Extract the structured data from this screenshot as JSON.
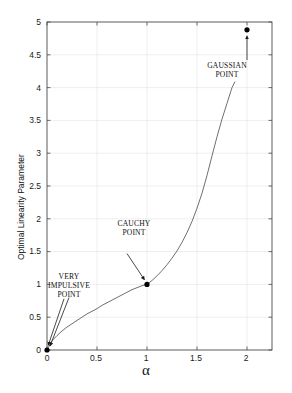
{
  "chart_data": {
    "type": "line",
    "title": "",
    "xlabel": "α",
    "ylabel": "Optimal Linearity Parameter",
    "xlim": [
      0,
      2.25
    ],
    "ylim": [
      0,
      5
    ],
    "grid": true,
    "grid_color": "#d9d9d9",
    "line_color": "#555555",
    "marker_color": "#000000",
    "xticks": [
      "0",
      "0.5",
      "1",
      "1.5",
      "2"
    ],
    "xtick_values": [
      0,
      0.5,
      1,
      1.5,
      2
    ],
    "yticks": [
      "0",
      "0.5",
      "1",
      "1.5",
      "2",
      "2.5",
      "3",
      "3.5",
      "4",
      "4.5",
      "5"
    ],
    "ytick_values": [
      0,
      0.5,
      1,
      1.5,
      2,
      2.5,
      3,
      3.5,
      4,
      4.5,
      5
    ],
    "series": [
      {
        "name": "optimal linearity parameter",
        "x": [
          0.0,
          0.05,
          0.1,
          0.15,
          0.2,
          0.25,
          0.3,
          0.35,
          0.4,
          0.45,
          0.5,
          0.55,
          0.6,
          0.65,
          0.7,
          0.75,
          0.8,
          0.85,
          0.9,
          0.95,
          1.0,
          1.05,
          1.1,
          1.15,
          1.2,
          1.25,
          1.3,
          1.35,
          1.4,
          1.45,
          1.5,
          1.55,
          1.6,
          1.65,
          1.7,
          1.75,
          1.8,
          1.85,
          1.88
        ],
        "y": [
          0.0,
          0.14,
          0.22,
          0.29,
          0.35,
          0.4,
          0.45,
          0.5,
          0.55,
          0.59,
          0.63,
          0.68,
          0.72,
          0.76,
          0.8,
          0.84,
          0.88,
          0.92,
          0.95,
          0.98,
          1.0,
          1.06,
          1.13,
          1.21,
          1.3,
          1.4,
          1.51,
          1.64,
          1.79,
          1.96,
          2.16,
          2.39,
          2.66,
          2.96,
          3.25,
          3.52,
          3.76,
          4.0,
          4.09
        ]
      }
    ],
    "points": [
      {
        "id": "very-impulsive-point",
        "x": 0.0,
        "y": 0.0,
        "label": "VERY\nIMPULSIVE\nPOINT"
      },
      {
        "id": "cauchy-point",
        "x": 1.0,
        "y": 1.0,
        "label": "CAUCHY\nPOINT"
      },
      {
        "id": "gaussian-point",
        "x": 2.0,
        "y": 4.88,
        "label": "GAUSSIAN\nPOINT"
      }
    ],
    "annotations": [
      {
        "id": "very-impulsive-annotation",
        "text": "VERY\nIMPULSIVE\nPOINT",
        "target_x": 0.0,
        "target_y": 0.05
      },
      {
        "id": "cauchy-annotation",
        "text": "CAUCHY\nPOINT",
        "target_x": 1.0,
        "target_y": 1.05
      },
      {
        "id": "gaussian-annotation",
        "text": "GAUSSIAN\nPOINT",
        "target_x": 2.0,
        "target_y": 4.78
      }
    ]
  }
}
